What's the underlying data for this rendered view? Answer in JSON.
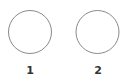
{
  "diagram": {
    "nodes": [
      {
        "id": "node-1",
        "label": "1",
        "cx": 30,
        "cy": 32,
        "r": 21.5
      },
      {
        "id": "node-2",
        "label": "2",
        "cx": 97.5,
        "cy": 32,
        "r": 21.5
      }
    ],
    "stroke_color": "#8a8a8a",
    "label_color": "#333333"
  }
}
